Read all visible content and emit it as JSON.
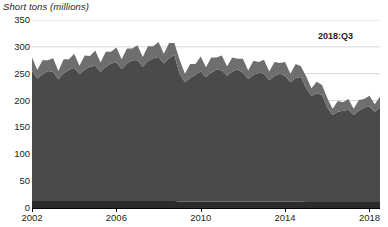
{
  "chart_data": {
    "type": "area",
    "stacked": true,
    "title": "",
    "subtitle": "",
    "xlabel": "",
    "ylabel": "Short tons (millions)",
    "ylim": [
      0,
      350
    ],
    "xlim": [
      2002.0,
      2018.5
    ],
    "grid": true,
    "legend_position": "none",
    "x_tick_labels": [
      "2002",
      "2006",
      "2010",
      "2014",
      "2018"
    ],
    "x_tick_values": [
      2002,
      2006,
      2010,
      2014,
      2018
    ],
    "y_tick_labels": [
      "0",
      "50",
      "100",
      "150",
      "200",
      "250",
      "300",
      "350"
    ],
    "y_tick_values": [
      0,
      50,
      100,
      150,
      200,
      250,
      300,
      350
    ],
    "annotations": [
      {
        "text": "2018:Q3",
        "x": 2017.2,
        "y": 330
      }
    ],
    "colors": {
      "bottom_layer": "#2b2b2b",
      "middle_layer": "#4a4a4a",
      "top_layer": "#6e6e6e",
      "gridline": "#d9d9d9",
      "axis": "#000000",
      "text": "#231f20"
    },
    "x": [
      2002.0,
      2002.25,
      2002.5,
      2002.75,
      2003.0,
      2003.25,
      2003.5,
      2003.75,
      2004.0,
      2004.25,
      2004.5,
      2004.75,
      2005.0,
      2005.25,
      2005.5,
      2005.75,
      2006.0,
      2006.25,
      2006.5,
      2006.75,
      2007.0,
      2007.25,
      2007.5,
      2007.75,
      2008.0,
      2008.25,
      2008.5,
      2008.75,
      2009.0,
      2009.25,
      2009.5,
      2009.75,
      2010.0,
      2010.25,
      2010.5,
      2010.75,
      2011.0,
      2011.25,
      2011.5,
      2011.75,
      2012.0,
      2012.25,
      2012.5,
      2012.75,
      2013.0,
      2013.25,
      2013.5,
      2013.75,
      2014.0,
      2014.25,
      2014.5,
      2014.75,
      2015.0,
      2015.25,
      2015.5,
      2015.75,
      2016.0,
      2016.25,
      2016.5,
      2016.75,
      2017.0,
      2017.25,
      2017.5,
      2017.75,
      2018.0,
      2018.25,
      2018.5
    ],
    "series": [
      {
        "name": "Bottom layer",
        "color": "#2b2b2b",
        "values": [
          13,
          13,
          13,
          13,
          13,
          13,
          13,
          13,
          13,
          13,
          13,
          13,
          13,
          13,
          13,
          13,
          13,
          13,
          13,
          13,
          13,
          13,
          13,
          13,
          13,
          13,
          13,
          13,
          12,
          12,
          12,
          12,
          12,
          12,
          12,
          12,
          12,
          12,
          12,
          12,
          12,
          12,
          12,
          12,
          12,
          12,
          12,
          12,
          12,
          12,
          12,
          12,
          11,
          11,
          11,
          11,
          11,
          11,
          11,
          11,
          11,
          11,
          11,
          11,
          11,
          11,
          11
        ]
      },
      {
        "name": "Middle layer",
        "color": "#4a4a4a",
        "values": [
          243,
          228,
          236,
          242,
          240,
          226,
          238,
          244,
          248,
          236,
          245,
          250,
          252,
          240,
          250,
          256,
          258,
          246,
          256,
          262,
          262,
          250,
          260,
          266,
          268,
          256,
          266,
          272,
          238,
          222,
          230,
          236,
          242,
          232,
          240,
          246,
          244,
          234,
          242,
          246,
          240,
          228,
          236,
          240,
          238,
          226,
          234,
          238,
          234,
          222,
          230,
          232,
          212,
          198,
          202,
          200,
          176,
          162,
          168,
          170,
          172,
          162,
          170,
          176,
          178,
          168,
          176
        ]
      },
      {
        "name": "Top layer",
        "color": "#6e6e6e",
        "values": [
          24,
          16,
          26,
          20,
          26,
          16,
          26,
          20,
          26,
          16,
          26,
          20,
          28,
          18,
          28,
          22,
          28,
          18,
          28,
          22,
          28,
          18,
          28,
          22,
          28,
          18,
          28,
          22,
          26,
          16,
          26,
          20,
          28,
          18,
          28,
          22,
          28,
          18,
          26,
          20,
          26,
          16,
          26,
          20,
          26,
          16,
          26,
          20,
          26,
          16,
          26,
          20,
          22,
          14,
          22,
          18,
          18,
          12,
          20,
          16,
          20,
          12,
          20,
          16,
          20,
          14,
          20
        ]
      }
    ],
    "totals_note": "Stacked totals peak near 310 in 2008, dip to ~258 in 2009, decline to ~175 in 2016, recover to ~200 by 2018:Q3"
  },
  "axis": {
    "ylabel": "Short tons (millions)"
  },
  "annotation": {
    "label": "2018:Q3"
  },
  "title_sliver": {
    "text": ""
  }
}
